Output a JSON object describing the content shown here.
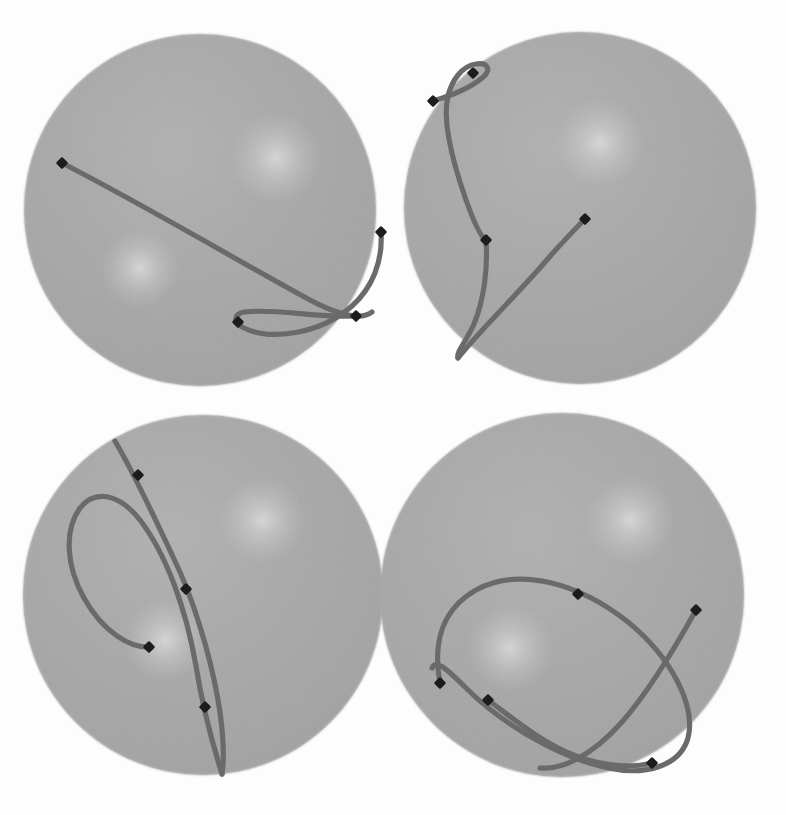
{
  "figure": {
    "background_color": "#fdfdfd",
    "width": 786,
    "height": 815,
    "panel_count": 4,
    "sphere_fill": "#ababab",
    "sphere_edge": "#a3a3a3",
    "sphere_highlight": "#cfcfcf",
    "curve_color": "#6b6b6b",
    "marker_color": "#1c1c1c",
    "curve_width": 5.2,
    "marker_size": 9
  },
  "chart_data": {
    "type": "scatter",
    "subtitle": "",
    "xlabel": "",
    "ylabel": "",
    "grid": false,
    "legend": "none",
    "xlim": [
      0,
      786
    ],
    "ylim": [
      0,
      815
    ],
    "panels": [
      {
        "name": "panel-top-left",
        "index": 1,
        "sphere": {
          "cx": 200,
          "cy": 210,
          "r": 176
        },
        "highlights": [
          {
            "cx": 276,
            "cy": 158,
            "r": 46
          },
          {
            "cx": 140,
            "cy": 268,
            "r": 40
          }
        ],
        "markers": [
          {
            "x": 62,
            "y": 163
          },
          {
            "x": 381,
            "y": 232
          },
          {
            "x": 356,
            "y": 316
          },
          {
            "x": 238,
            "y": 322
          }
        ],
        "curves": [
          {
            "name": "long-chord",
            "path": "M 62,163 C 150,208 250,268 310,300 C 340,316 362,320 372,312"
          },
          {
            "name": "lower-loop",
            "path": "M 381,232 C 383,262 372,288 352,306 C 318,336 268,340 244,328 C 232,322 234,314 244,312 C 272,308 320,318 356,316"
          }
        ]
      },
      {
        "name": "panel-top-right",
        "index": 2,
        "sphere": {
          "cx": 580,
          "cy": 208,
          "r": 176
        },
        "highlights": [
          {
            "cx": 600,
            "cy": 143,
            "r": 45
          }
        ],
        "markers": [
          {
            "x": 473,
            "y": 73
          },
          {
            "x": 433,
            "y": 101
          },
          {
            "x": 486,
            "y": 240
          },
          {
            "x": 585,
            "y": 219
          }
        ],
        "curves": [
          {
            "name": "upper-small-loop",
            "path": "M 433,101 C 450,96 470,88 482,78 C 492,70 488,62 476,64 C 462,66 452,80 448,96 C 442,120 452,160 466,200 C 476,228 482,238 486,240"
          },
          {
            "name": "long-descending-arc",
            "path": "M 486,240 C 488,268 484,300 474,324 C 466,342 456,352 458,358"
          },
          {
            "name": "rising-branch",
            "path": "M 458,358 C 480,330 520,292 552,254 C 572,232 582,222 585,219"
          }
        ]
      },
      {
        "name": "panel-bottom-left",
        "index": 3,
        "sphere": {
          "cx": 203,
          "cy": 595,
          "r": 180
        },
        "highlights": [
          {
            "cx": 262,
            "cy": 520,
            "r": 44
          },
          {
            "cx": 165,
            "cy": 640,
            "r": 42
          }
        ],
        "markers": [
          {
            "x": 138,
            "y": 475
          },
          {
            "x": 186,
            "y": 589
          },
          {
            "x": 149,
            "y": 647
          },
          {
            "x": 205,
            "y": 707
          }
        ],
        "curves": [
          {
            "name": "steep-descending-arc",
            "path": "M 115,441 C 132,470 156,520 180,572 C 200,618 214,672 220,712 C 224,742 224,762 222,774"
          },
          {
            "name": "long-loop",
            "path": "M 222,774 C 212,742 202,704 196,666 C 186,608 166,554 140,520 C 118,492 94,490 80,508 C 64,530 66,566 84,598 C 104,634 132,648 149,647"
          }
        ]
      },
      {
        "name": "panel-bottom-right",
        "index": 4,
        "sphere": {
          "cx": 562,
          "cy": 595,
          "r": 182
        },
        "highlights": [
          {
            "cx": 630,
            "cy": 520,
            "r": 45
          },
          {
            "cx": 510,
            "cy": 648,
            "r": 44
          }
        ],
        "markers": [
          {
            "x": 578,
            "y": 594
          },
          {
            "x": 696,
            "y": 610
          },
          {
            "x": 440,
            "y": 683
          },
          {
            "x": 488,
            "y": 700
          },
          {
            "x": 652,
            "y": 763
          }
        ],
        "curves": [
          {
            "name": "large-teardrop-loop",
            "path": "M 440,683 C 432,640 444,608 476,590 C 520,566 580,584 628,622 C 672,658 696,706 688,738 C 680,766 646,776 608,768 C 552,756 496,718 466,688 C 444,666 436,660 432,668"
          },
          {
            "name": "crossing-branch",
            "path": "M 696,610 C 676,646 650,690 622,722 C 590,758 560,770 540,768"
          },
          {
            "name": "short-branch",
            "path": "M 488,700 C 510,716 540,742 576,756 C 612,770 640,766 652,763"
          }
        ]
      }
    ]
  }
}
